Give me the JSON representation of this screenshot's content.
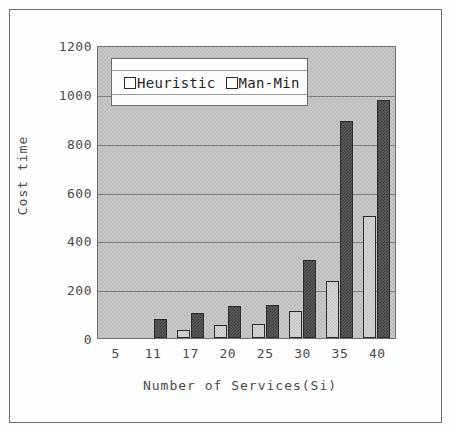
{
  "chart_data": {
    "type": "bar",
    "title": "",
    "xlabel": "Number of Services(Si)",
    "ylabel": "Cost time",
    "categories": [
      "5",
      "11",
      "17",
      "20",
      "25",
      "30",
      "35",
      "40"
    ],
    "series": [
      {
        "name": "Heuristic",
        "values": [
          0,
          0,
          33,
          52,
          57,
          110,
          235,
          500
        ],
        "color": "#d8d8d8"
      },
      {
        "name": "Man-Min",
        "values": [
          0,
          78,
          102,
          130,
          137,
          320,
          890,
          975
        ],
        "color": "#5c5c5c"
      }
    ],
    "ylim": [
      0,
      1200
    ],
    "yticks": [
      "0",
      "200",
      "400",
      "600",
      "800",
      "1000",
      "1200"
    ],
    "ytick_values": [
      0,
      200,
      400,
      600,
      800,
      1000,
      1200
    ],
    "grid": true,
    "legend_position": "top-left",
    "plot_background": "#c9c9c9",
    "axis_color": "#4a4a4a"
  },
  "legend": {
    "entries": [
      {
        "label": "Heuristic",
        "swatch": "heuristic-swatch"
      },
      {
        "label": "Man-Min",
        "swatch": "manmin-swatch"
      }
    ]
  }
}
